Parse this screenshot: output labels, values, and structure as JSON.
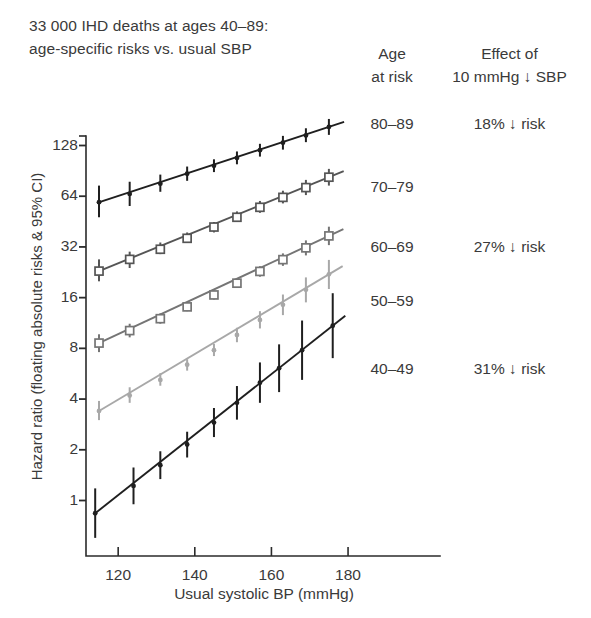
{
  "title": {
    "line1": "33 000 IHD deaths at ages 40–89:",
    "line2": "age-specific risks vs. usual SBP"
  },
  "legend_headers": {
    "age": {
      "line1": "Age",
      "line2": "at risk"
    },
    "effect": {
      "line1": "Effect of",
      "line2": "10 mmHg ↓ SBP"
    }
  },
  "legend_rows": [
    {
      "age": "80–89",
      "effect": "18% ↓ risk",
      "y": 115
    },
    {
      "age": "70–79",
      "effect": "",
      "y": 178
    },
    {
      "age": "60–69",
      "effect": "27% ↓ risk",
      "y": 238
    },
    {
      "age": "50–59",
      "effect": "",
      "y": 292
    },
    {
      "age": "40–49",
      "effect": "31% ↓ risk",
      "y": 360
    }
  ],
  "chart_data": {
    "type": "scatter",
    "title": "33 000 IHD deaths at ages 40–89: age-specific risks vs. usual SBP",
    "xlabel": "Usual systolic BP (mmHg)",
    "ylabel": "Hazard ratio (floating absolute risks & 95% CI)",
    "xlim": [
      112,
      190
    ],
    "ylim": [
      0.7,
      200
    ],
    "yscale": "log2",
    "grid": false,
    "legend_position": "right",
    "xticks": [
      120,
      140,
      160,
      180
    ],
    "yticks": [
      1,
      2,
      4,
      8,
      16,
      32,
      64,
      128
    ],
    "annotations": [
      "18% ↓ risk at ages 80–89",
      "27% ↓ risk at ages 60–69",
      "31% ↓ risk at ages 40–49"
    ],
    "series": [
      {
        "name": "80–89",
        "color": "#1f1f1f",
        "marker": "cross",
        "points": [
          {
            "x": 115,
            "y": 59,
            "lo": 48,
            "hi": 74
          },
          {
            "x": 123,
            "y": 66,
            "lo": 56,
            "hi": 78
          },
          {
            "x": 131,
            "y": 76,
            "lo": 68,
            "hi": 86
          },
          {
            "x": 138,
            "y": 87,
            "lo": 79,
            "hi": 96
          },
          {
            "x": 145,
            "y": 97,
            "lo": 89,
            "hi": 106
          },
          {
            "x": 151,
            "y": 108,
            "lo": 99,
            "hi": 118
          },
          {
            "x": 157,
            "y": 120,
            "lo": 110,
            "hi": 131
          },
          {
            "x": 163,
            "y": 133,
            "lo": 121,
            "hi": 146
          },
          {
            "x": 169,
            "y": 147,
            "lo": 134,
            "hi": 162
          },
          {
            "x": 175,
            "y": 165,
            "lo": 148,
            "hi": 184
          }
        ]
      },
      {
        "name": "70–79",
        "color": "#555555",
        "marker": "square",
        "points": [
          {
            "x": 115,
            "y": 23,
            "lo": 20,
            "hi": 27
          },
          {
            "x": 123,
            "y": 27,
            "lo": 24,
            "hi": 30
          },
          {
            "x": 131,
            "y": 31,
            "lo": 29,
            "hi": 34
          },
          {
            "x": 138,
            "y": 36,
            "lo": 34,
            "hi": 39
          },
          {
            "x": 145,
            "y": 42,
            "lo": 39,
            "hi": 45
          },
          {
            "x": 151,
            "y": 48,
            "lo": 45,
            "hi": 52
          },
          {
            "x": 157,
            "y": 55,
            "lo": 51,
            "hi": 60
          },
          {
            "x": 163,
            "y": 63,
            "lo": 58,
            "hi": 69
          },
          {
            "x": 169,
            "y": 72,
            "lo": 65,
            "hi": 80
          },
          {
            "x": 175,
            "y": 83,
            "lo": 74,
            "hi": 93
          }
        ]
      },
      {
        "name": "60–69",
        "color": "#757575",
        "marker": "square",
        "points": [
          {
            "x": 115,
            "y": 8.6,
            "lo": 7.6,
            "hi": 9.7
          },
          {
            "x": 123,
            "y": 10.2,
            "lo": 9.3,
            "hi": 11.2
          },
          {
            "x": 131,
            "y": 12.0,
            "lo": 11.2,
            "hi": 12.9
          },
          {
            "x": 138,
            "y": 14.1,
            "lo": 13.3,
            "hi": 15.0
          },
          {
            "x": 145,
            "y": 16.6,
            "lo": 15.6,
            "hi": 17.6
          },
          {
            "x": 151,
            "y": 19.5,
            "lo": 18.3,
            "hi": 20.8
          },
          {
            "x": 157,
            "y": 22.9,
            "lo": 21.3,
            "hi": 24.6
          },
          {
            "x": 163,
            "y": 26.9,
            "lo": 24.7,
            "hi": 29.3
          },
          {
            "x": 169,
            "y": 31.6,
            "lo": 28.5,
            "hi": 35.0
          },
          {
            "x": 175,
            "y": 37.2,
            "lo": 32.8,
            "hi": 42.2
          }
        ]
      },
      {
        "name": "50–59",
        "color": "#a8a8a8",
        "marker": "cross",
        "points": [
          {
            "x": 115,
            "y": 3.4,
            "lo": 3.0,
            "hi": 3.9
          },
          {
            "x": 123,
            "y": 4.2,
            "lo": 3.8,
            "hi": 4.7
          },
          {
            "x": 131,
            "y": 5.2,
            "lo": 4.8,
            "hi": 5.7
          },
          {
            "x": 138,
            "y": 6.4,
            "lo": 5.9,
            "hi": 6.9
          },
          {
            "x": 145,
            "y": 7.8,
            "lo": 7.2,
            "hi": 8.5
          },
          {
            "x": 151,
            "y": 9.6,
            "lo": 8.7,
            "hi": 10.6
          },
          {
            "x": 157,
            "y": 11.8,
            "lo": 10.5,
            "hi": 13.3
          },
          {
            "x": 163,
            "y": 14.5,
            "lo": 12.6,
            "hi": 16.7
          },
          {
            "x": 169,
            "y": 17.8,
            "lo": 15.0,
            "hi": 21.1
          },
          {
            "x": 175,
            "y": 22.0,
            "lo": 18.0,
            "hi": 26.8
          }
        ]
      },
      {
        "name": "40–49",
        "color": "#1f1f1f",
        "marker": "cross",
        "points": [
          {
            "x": 114,
            "y": 0.84,
            "lo": 0.6,
            "hi": 1.18
          },
          {
            "x": 124,
            "y": 1.22,
            "lo": 0.95,
            "hi": 1.57
          },
          {
            "x": 131,
            "y": 1.62,
            "lo": 1.34,
            "hi": 1.96
          },
          {
            "x": 138,
            "y": 2.15,
            "lo": 1.8,
            "hi": 2.56
          },
          {
            "x": 145,
            "y": 2.9,
            "lo": 2.38,
            "hi": 3.54
          },
          {
            "x": 151,
            "y": 3.8,
            "lo": 3.02,
            "hi": 4.78
          },
          {
            "x": 157,
            "y": 5.0,
            "lo": 3.8,
            "hi": 6.6
          },
          {
            "x": 162,
            "y": 6.1,
            "lo": 4.4,
            "hi": 8.45
          },
          {
            "x": 168,
            "y": 7.8,
            "lo": 5.2,
            "hi": 11.7
          },
          {
            "x": 176,
            "y": 10.9,
            "lo": 7.0,
            "hi": 17.0
          }
        ]
      }
    ]
  },
  "axes": {
    "xticks": [
      {
        "label": "120",
        "v": 120
      },
      {
        "label": "140",
        "v": 140
      },
      {
        "label": "160",
        "v": 160
      },
      {
        "label": "180",
        "v": 180
      }
    ],
    "yticks": [
      {
        "label": "128",
        "v": 128
      },
      {
        "label": "64",
        "v": 64
      },
      {
        "label": "32",
        "v": 32
      },
      {
        "label": "16",
        "v": 16
      },
      {
        "label": "8",
        "v": 8
      },
      {
        "label": "4",
        "v": 4
      },
      {
        "label": "2",
        "v": 2
      },
      {
        "label": "1",
        "v": 1
      }
    ],
    "xlabel": "Usual systolic BP (mmHg)",
    "ylabel": "Hazard ratio (floating absolute risks & 95% CI)"
  }
}
